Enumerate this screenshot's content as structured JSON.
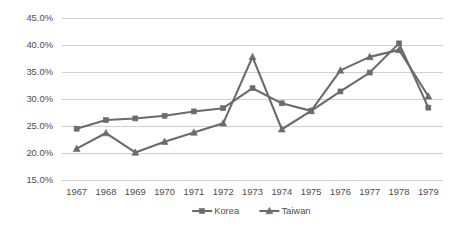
{
  "chart_data": {
    "type": "line",
    "title": "",
    "xlabel": "",
    "ylabel": "",
    "categories": [
      "1967",
      "1968",
      "1969",
      "1970",
      "1971",
      "1972",
      "1973",
      "1974",
      "1975",
      "1976",
      "1977",
      "1978",
      "1979"
    ],
    "ytick_labels": [
      "45.0%",
      "40.0%",
      "35.0%",
      "30.0%",
      "25.0%",
      "20.0%",
      "15.0%"
    ],
    "ytick_values": [
      45.0,
      40.0,
      35.0,
      30.0,
      25.0,
      20.0,
      15.0
    ],
    "ylim": [
      15.0,
      45.0
    ],
    "grid": true,
    "grid_axis": "y",
    "legend_position": "bottom",
    "series": [
      {
        "name": "Korea",
        "marker": "square",
        "color": "#6b6b6b",
        "values": [
          24.5,
          26.1,
          26.4,
          26.9,
          27.7,
          28.3,
          32.0,
          29.2,
          27.8,
          31.4,
          34.9,
          40.3,
          28.4
        ]
      },
      {
        "name": "Taiwan",
        "marker": "triangle",
        "color": "#6b6b6b",
        "values": [
          20.8,
          23.7,
          20.1,
          22.1,
          23.8,
          25.5,
          37.8,
          24.4,
          27.8,
          35.3,
          37.8,
          39.1,
          30.5
        ]
      }
    ]
  },
  "colors": {
    "series": "#6b6b6b",
    "gridline": "#d0d0d0",
    "text": "#4d4d4d",
    "background": "#ffffff"
  }
}
